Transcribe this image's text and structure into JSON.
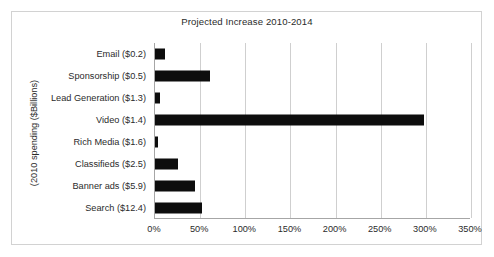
{
  "chart_data": {
    "type": "bar",
    "orientation": "horizontal",
    "title": "Projected Increase 2010-2014",
    "xlabel": "",
    "ylabel": "(2010 spending ($Billions)",
    "categories": [
      "Email ($0.2)",
      "Sponsorship ($0.5)",
      "Lead Generation ($1.3)",
      "Video ($1.4)",
      "Rich Media ($1.6)",
      "Classifieds ($2.5)",
      "Banner ads ($5.9)",
      "Search ($12.4)"
    ],
    "values": [
      11,
      61,
      5,
      298,
      3,
      26,
      44,
      52
    ],
    "value_unit": "percent",
    "xlim": [
      0,
      350
    ],
    "xticks": [
      0,
      50,
      100,
      150,
      200,
      250,
      300,
      350
    ],
    "xtick_labels": [
      "0%",
      "50%",
      "100%",
      "150%",
      "200%",
      "250%",
      "300%",
      "350%"
    ],
    "grid": "vertical",
    "legend": "none",
    "bar_color": "#0d0d0d",
    "gridline_color": "#cfcfcf",
    "axis_color": "#a6a6a6",
    "frame_color": "#d2d2d2",
    "background": "#ffffff",
    "text_color": "#2b2b2b"
  }
}
